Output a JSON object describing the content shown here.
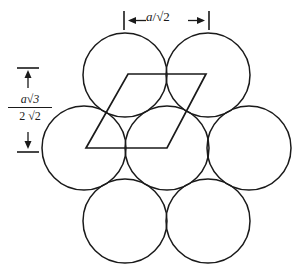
{
  "figure": {
    "background_color": "#ffffff",
    "stroke_color": "#1a1a1a",
    "width": 298,
    "height": 274
  },
  "dimensions": {
    "horizontal": {
      "label_text": "a/√2",
      "label_parts": {
        "variable": "a",
        "slash": "/",
        "radical": "√2"
      },
      "arrow_left": "←",
      "arrow_right": "→",
      "tick_left_x": 124,
      "tick_right_x": 209,
      "value_description": "distance between adjacent sphere centers"
    },
    "vertical": {
      "label_numerator": "a√3",
      "label_denominator": "2 √2",
      "numerator_parts": {
        "variable": "a",
        "radical": "√3"
      },
      "denominator_parts": {
        "coefficient": "2",
        "radical": "√2"
      },
      "arrow_up": "↑",
      "arrow_down": "↓",
      "tick_top_y": 68,
      "tick_bottom_y": 152,
      "value_description": "row spacing of close-packed rows"
    }
  },
  "spheres": {
    "radius": 42,
    "count": 7,
    "rows": [
      {
        "name": "top-row",
        "centers": [
          {
            "cx": 125,
            "cy": 75
          },
          {
            "cx": 208,
            "cy": 75
          }
        ]
      },
      {
        "name": "middle-row",
        "centers": [
          {
            "cx": 84,
            "cy": 148
          },
          {
            "cx": 167,
            "cy": 148
          },
          {
            "cx": 249,
            "cy": 148
          }
        ]
      },
      {
        "name": "bottom-row",
        "centers": [
          {
            "cx": 125,
            "cy": 221
          },
          {
            "cx": 208,
            "cy": 221
          }
        ]
      }
    ]
  },
  "unit_cell": {
    "shape": "rhombus",
    "vertices": [
      {
        "x": 128,
        "y": 74
      },
      {
        "x": 206,
        "y": 74
      },
      {
        "x": 167,
        "y": 148
      },
      {
        "x": 86,
        "y": 148
      }
    ],
    "points_attr": "128,74 206,74 167,148 86,148",
    "interior_angles_deg": [
      60,
      120,
      60,
      120
    ]
  }
}
